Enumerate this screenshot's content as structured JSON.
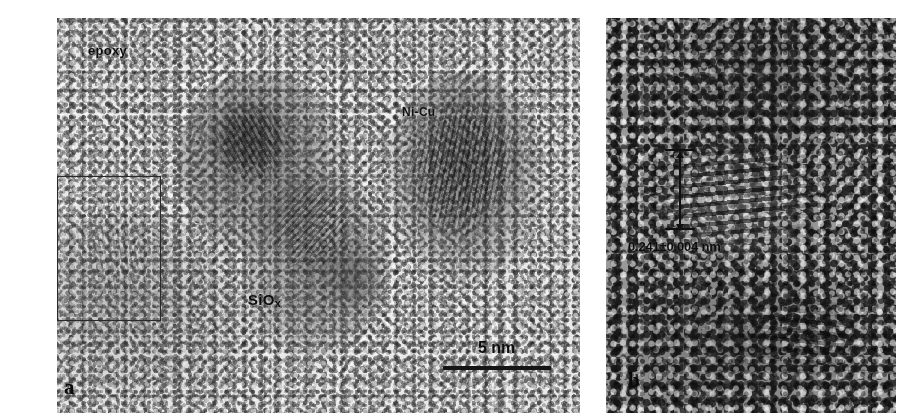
{
  "figure": {
    "type": "hrtem-micrograph-figure",
    "width": 903,
    "height": 420,
    "background_color": "#ffffff"
  },
  "panels": [
    {
      "id": "a",
      "letter": "a",
      "kind": "hrtem-overview",
      "x": 57,
      "y": 18,
      "width": 523,
      "height": 395,
      "mean_tone": "#e3e3e3",
      "labels": [
        {
          "name": "epoxy-label",
          "text": "epoxy",
          "x": 88,
          "y": 44,
          "font_size": 13
        },
        {
          "name": "nicu-label",
          "text": "Ni-Cu",
          "x": 402,
          "y": 106,
          "font_size": 12
        },
        {
          "name": "siox-label",
          "text": "SiO",
          "sub": "x",
          "x": 248,
          "y": 292,
          "font_size": 15
        }
      ],
      "selection_rect": {
        "name": "inset-selection-rect",
        "x": 57,
        "y": 176,
        "width": 104,
        "height": 145
      },
      "scale_bar": {
        "name": "scale-bar",
        "label": "5 nm",
        "label_x": 478,
        "label_y": 340,
        "bar_x": 443,
        "bar_y": 366,
        "bar_width": 108,
        "bar_height": 4
      },
      "letter_x": 64,
      "letter_y": 378
    },
    {
      "id": "b",
      "letter": "b",
      "kind": "hrtem-lattice-closeup",
      "x": 606,
      "y": 18,
      "width": 290,
      "height": 395,
      "mean_tone": "#8f8f8f",
      "labels": [
        {
          "name": "d-spacing-label",
          "text": "0.241±0.004 nm",
          "x": 628,
          "y": 239,
          "font_size": 13
        }
      ],
      "measurement": {
        "name": "d-spacing-arrow",
        "x": 679,
        "y_top": 152,
        "y_bottom": 224,
        "value": "0.241±0.004 nm",
        "description": "lattice fringe spacing indicator"
      },
      "letter_x": 628,
      "letter_y": 372
    }
  ],
  "colors": {
    "ink": "#111111",
    "panel_a_base": "#e9e9e9",
    "panel_b_base": "#9a9a9a",
    "rect_stroke": "#2a2a2a",
    "scale_bar": "#151515"
  }
}
